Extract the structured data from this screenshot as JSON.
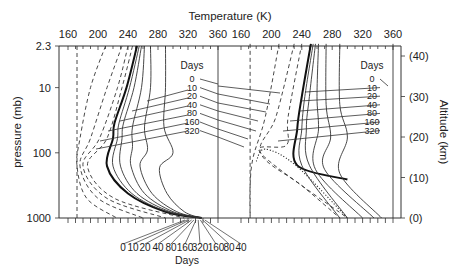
{
  "chart_data": [
    {
      "type": "line",
      "panel": "left",
      "title": "",
      "xlabel": "Temperature (K)",
      "ylabel": "pressure (mb)",
      "xlim": [
        160,
        360
      ],
      "ylim_pressure_mb": [
        1000,
        2.3
      ],
      "y_scale": "log",
      "x_ticks": [
        160,
        200,
        240,
        280,
        320,
        360
      ],
      "y_ticks": [
        "2.3",
        "10",
        "100",
        "1000"
      ],
      "legend_title": "Days",
      "legend_entries": [
        "0",
        "10",
        "20",
        "40",
        "80",
        "160",
        "320"
      ],
      "series": [
        {
          "name": "0",
          "style": "thick solid",
          "points": [
            [
              252,
              2.3
            ],
            [
              238,
              10
            ],
            [
              222,
              35
            ],
            [
              220,
              60
            ],
            [
              212,
              160
            ],
            [
              240,
              420
            ],
            [
              290,
              800
            ],
            [
              338,
              1000
            ]
          ]
        },
        {
          "name": "10",
          "style": "solid",
          "points": [
            [
              255,
              2.3
            ],
            [
              242,
              10
            ],
            [
              228,
              35
            ],
            [
              226,
              60
            ],
            [
              220,
              160
            ],
            [
              245,
              420
            ],
            [
              292,
              800
            ],
            [
              338,
              1000
            ]
          ]
        },
        {
          "name": "20",
          "style": "solid",
          "points": [
            [
              258,
              2.3
            ],
            [
              248,
              10
            ],
            [
              234,
              35
            ],
            [
              232,
              60
            ],
            [
              230,
              160
            ],
            [
              252,
              420
            ],
            [
              296,
              800
            ],
            [
              338,
              1000
            ]
          ]
        },
        {
          "name": "40",
          "style": "solid",
          "points": [
            [
              262,
              2.3
            ],
            [
              258,
              10
            ],
            [
              246,
              40
            ],
            [
              246,
              80
            ],
            [
              244,
              160
            ],
            [
              262,
              420
            ],
            [
              300,
              800
            ],
            [
              338,
              1000
            ]
          ]
        },
        {
          "name": "80",
          "style": "solid",
          "points": [
            [
              270,
              2.3
            ],
            [
              270,
              10
            ],
            [
              262,
              40
            ],
            [
              266,
              90
            ],
            [
              256,
              160
            ],
            [
              272,
              420
            ],
            [
              305,
              800
            ],
            [
              338,
              1000
            ]
          ]
        },
        {
          "name": "160",
          "style": "solid",
          "points": [
            [
              290,
              2.3
            ],
            [
              290,
              10
            ],
            [
              288,
              40
            ],
            [
              300,
              100
            ],
            [
              282,
              170
            ],
            [
              292,
              420
            ],
            [
              315,
              800
            ],
            [
              338,
              1000
            ]
          ]
        },
        {
          "name": "320",
          "style": "solid",
          "points": [
            [
              360,
              2.3
            ],
            [
              360,
              1000
            ]
          ]
        },
        {
          "name": "dashed-1",
          "style": "dashed",
          "points": [
            [
              172,
              2.3
            ],
            [
              172,
              1000
            ]
          ]
        },
        {
          "name": "dashed-2",
          "style": "dashed",
          "points": [
            [
              210,
              2.3
            ],
            [
              190,
              10
            ],
            [
              176,
              60
            ],
            [
              172,
              160
            ],
            [
              185,
              500
            ],
            [
              225,
              1000
            ]
          ]
        },
        {
          "name": "dashed-3",
          "style": "dashed",
          "points": [
            [
              232,
              2.3
            ],
            [
              212,
              10
            ],
            [
              190,
              60
            ],
            [
              176,
              160
            ],
            [
              200,
              500
            ],
            [
              260,
              1000
            ]
          ]
        },
        {
          "name": "dashed-4",
          "style": "dashed",
          "points": [
            [
              240,
              2.3
            ],
            [
              226,
              10
            ],
            [
              202,
              60
            ],
            [
              180,
              160
            ],
            [
              212,
              500
            ],
            [
              290,
              1000
            ]
          ]
        },
        {
          "name": "dashed-5",
          "style": "dashed",
          "points": [
            [
              246,
              2.3
            ],
            [
              232,
              10
            ],
            [
              212,
              60
            ],
            [
              186,
              160
            ],
            [
              222,
              500
            ],
            [
              315,
              1000
            ]
          ]
        }
      ],
      "annotations": {
        "bottom_days_labels": [
          "0",
          "10",
          "20",
          "40",
          "80",
          "160",
          "320",
          "160",
          "80",
          "40"
        ],
        "bottom_days_title": "Days"
      }
    },
    {
      "type": "line",
      "panel": "right",
      "xlabel": "Temperature (K)",
      "ylabel": "Altitude (km)",
      "xlim": [
        160,
        360
      ],
      "ylim_altitude_km": [
        0,
        43
      ],
      "x_ticks": [
        160,
        200,
        240,
        280,
        320,
        360
      ],
      "y_ticks": [
        "(0)",
        "(10)",
        "(20)",
        "(30)",
        "(40)"
      ],
      "legend_title": "Days",
      "legend_entries": [
        "0",
        "10",
        "20",
        "40",
        "80",
        "160",
        "320"
      ],
      "series": [
        {
          "name": "0",
          "style": "thick solid",
          "points": [
            [
              252,
              43
            ],
            [
              240,
              30
            ],
            [
              234,
              22
            ],
            [
              234,
              13
            ],
            [
              300,
              9.5
            ]
          ]
        },
        {
          "name": "10",
          "style": "solid",
          "points": [
            [
              255,
              43
            ],
            [
              244,
              30
            ],
            [
              240,
              22
            ],
            [
              240,
              13
            ],
            [
              290,
              0
            ]
          ]
        },
        {
          "name": "20",
          "style": "solid",
          "points": [
            [
              258,
              43
            ],
            [
              250,
              30
            ],
            [
              246,
              22
            ],
            [
              250,
              13
            ],
            [
              300,
              0
            ]
          ]
        },
        {
          "name": "40",
          "style": "solid",
          "points": [
            [
              262,
              43
            ],
            [
              260,
              30
            ],
            [
              262,
              22
            ],
            [
              258,
              12
            ],
            [
              320,
              0
            ]
          ]
        },
        {
          "name": "80",
          "style": "solid",
          "points": [
            [
              272,
              43
            ],
            [
              272,
              28
            ],
            [
              278,
              20
            ],
            [
              270,
              12
            ],
            [
              335,
              0
            ]
          ]
        },
        {
          "name": "160",
          "style": "solid",
          "points": [
            [
              290,
              43
            ],
            [
              290,
              28
            ],
            [
              300,
              20
            ],
            [
              290,
              11
            ],
            [
              345,
              0
            ]
          ]
        },
        {
          "name": "320",
          "style": "solid",
          "points": [
            [
              360,
              43
            ],
            [
              360,
              0
            ]
          ]
        },
        {
          "name": "dashed-1",
          "style": "dashed",
          "points": [
            [
              172,
              43
            ],
            [
              172,
              0
            ]
          ]
        },
        {
          "name": "dashed-2",
          "style": "dashed",
          "points": [
            [
              210,
              43
            ],
            [
              192,
              25
            ],
            [
              176,
              15
            ],
            [
              172,
              8
            ],
            [
              172,
              0
            ]
          ]
        },
        {
          "name": "dashed-3",
          "style": "dashed",
          "points": [
            [
              230,
              43
            ],
            [
              206,
              25
            ],
            [
              186,
              16
            ],
            [
              240,
              8
            ],
            [
              290,
              0
            ]
          ]
        },
        {
          "name": "dashed-4",
          "style": "dashed",
          "points": [
            [
              240,
              43
            ],
            [
              222,
              25
            ],
            [
              220,
              18
            ],
            [
              186,
              16
            ],
            [
              300,
              0
            ]
          ]
        },
        {
          "name": "dotted-0",
          "style": "dotted",
          "points": [
            [
              180,
              14
            ],
            [
              192,
              17
            ],
            [
              232,
              13
            ],
            [
              300,
              0
            ]
          ]
        }
      ]
    }
  ],
  "labels": {
    "top_axis_title": "Temperature (K)",
    "left_axis_title": "pressure (mb)",
    "right_axis_title": "Altitude (km)",
    "left_x_ticks": [
      "160",
      "200",
      "240",
      "280",
      "320",
      "360"
    ],
    "right_x_ticks": [
      "160",
      "200",
      "240",
      "280",
      "320",
      "360"
    ],
    "left_y_ticks": [
      "2.3",
      "10",
      "100",
      "1000"
    ],
    "right_y_ticks": [
      "(40)",
      "(30)",
      "(20)",
      "(10)",
      "(0)"
    ],
    "legend_title": "Days",
    "legend_entries": [
      "0",
      "10",
      "20",
      "40",
      "80",
      "160",
      "320"
    ],
    "bottom_days_labels": [
      "0",
      "10",
      "20",
      "40",
      "80",
      "160",
      "320",
      "160",
      "80",
      "40"
    ],
    "bottom_days_title": "Days"
  }
}
